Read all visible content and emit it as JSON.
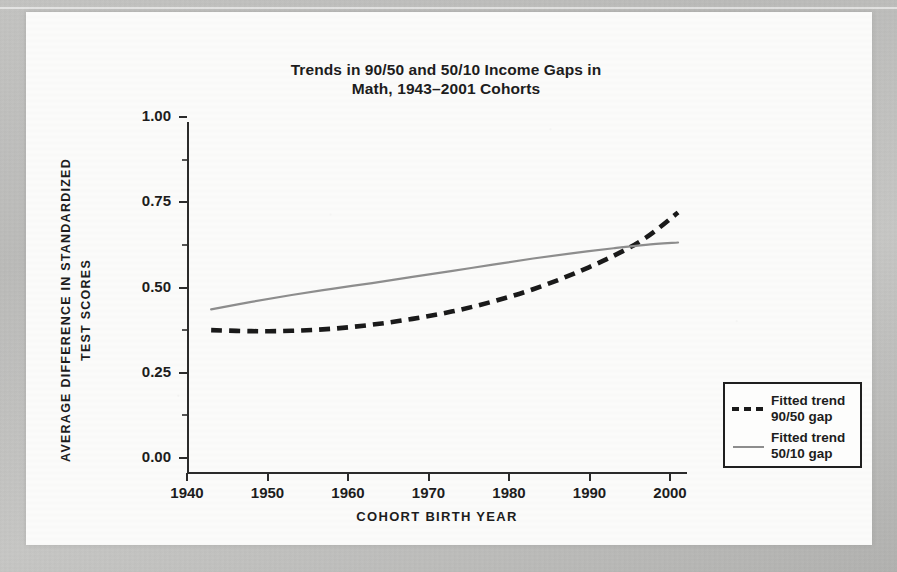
{
  "chart_data": {
    "type": "line",
    "title": "Trends in 90/50 and 50/10 Income Gaps in\nMath, 1943–2001 Cohorts",
    "xlabel": "COHORT BIRTH YEAR",
    "ylabel": "AVERAGE DIFFERENCE IN STANDARDIZED\nTEST SCORES",
    "xlim": [
      1938,
      2004
    ],
    "ylim": [
      0.0,
      1.0
    ],
    "xticks": [
      1940,
      1950,
      1960,
      1970,
      1980,
      1990,
      2000
    ],
    "xtick_labels": [
      "1940",
      "1950",
      "1960",
      "1970",
      "1980",
      "1990",
      "2000"
    ],
    "yticks": [
      0.0,
      0.25,
      0.5,
      0.75,
      1.0
    ],
    "ytick_labels": [
      "0.00",
      "0.25",
      "0.50",
      "0.75",
      "1.00"
    ],
    "grid": false,
    "legend_position": "right-outside",
    "series": [
      {
        "name": "Fitted trend\n90/50 gap",
        "style": "dashed",
        "color": "#1a1a1a",
        "x": [
          1943,
          1948,
          1953,
          1958,
          1963,
          1968,
          1973,
          1978,
          1983,
          1988,
          1993,
          1997,
          2001
        ],
        "y": [
          0.375,
          0.372,
          0.373,
          0.379,
          0.391,
          0.408,
          0.43,
          0.459,
          0.495,
          0.54,
          0.593,
          0.646,
          0.72
        ]
      },
      {
        "name": "Fitted trend\n50/10 gap",
        "style": "solid",
        "color": "#8d8d8d",
        "x": [
          1943,
          1948,
          1953,
          1958,
          1963,
          1968,
          1973,
          1978,
          1983,
          1988,
          1993,
          1997,
          2001
        ],
        "y": [
          0.436,
          0.458,
          0.478,
          0.496,
          0.513,
          0.531,
          0.549,
          0.567,
          0.585,
          0.601,
          0.615,
          0.625,
          0.632
        ]
      }
    ]
  },
  "legend": {
    "items": [
      {
        "label": "Fitted trend\n90/50 gap",
        "swatch": "dashed"
      },
      {
        "label": "Fitted trend\n50/10 gap",
        "swatch": "solid"
      }
    ]
  }
}
